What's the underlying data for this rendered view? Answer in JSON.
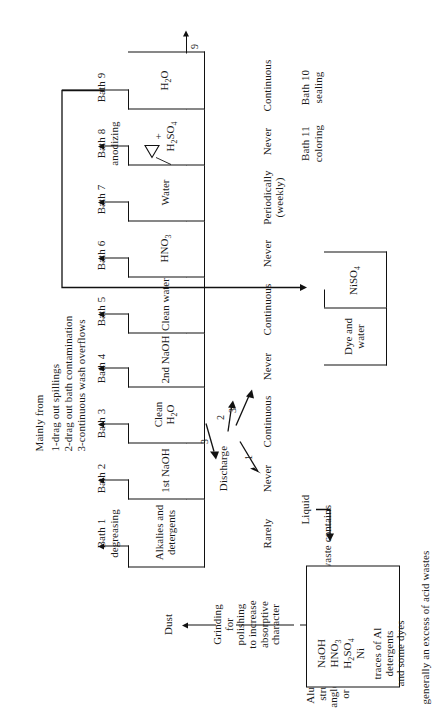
{
  "diagram": {
    "title_hidden": "Aluminum anodizing process flow and waste discharge",
    "feed": {
      "material": "Aluminum\nstructural\nangles, rods,\nor plates",
      "operation": "Grinding\nfor\npolishing\nto increase\nabsorptive\ncharacter",
      "air_waste": "Dust",
      "solid_waste": "Solid\nwaste"
    },
    "discharge_label": "Discharge",
    "baths": [
      {
        "id": 1,
        "name": "Bath 1",
        "subtitle": "degreasing",
        "contents": "Alkalies\nand\ndetergents",
        "stream": "1",
        "frequency": "Rarely"
      },
      {
        "id": 2,
        "name": "Bath 2",
        "subtitle": "",
        "contents": "1st\nNaOH",
        "stream": "2",
        "frequency": "Never"
      },
      {
        "id": 3,
        "name": "Bath 3",
        "subtitle": "",
        "contents": "Clean\nH2O",
        "stream": "3",
        "frequency": "Continuous"
      },
      {
        "id": 4,
        "name": "Bath 4",
        "subtitle": "",
        "contents": "2nd\nNaOH",
        "stream": "4",
        "frequency": "Never"
      },
      {
        "id": 5,
        "name": "Bath 5",
        "subtitle": "",
        "contents": "Clean\nwater",
        "stream": "5",
        "frequency": "Continuous"
      },
      {
        "id": 6,
        "name": "Bath 6",
        "subtitle": "",
        "contents": "HNO3",
        "stream": "6",
        "frequency": "Never"
      },
      {
        "id": 7,
        "name": "Bath 7",
        "subtitle": "",
        "contents": "Water",
        "stream": "7",
        "frequency": "Periodically\n(weekly)"
      },
      {
        "id": 8,
        "name": "Bath 8",
        "subtitle": "anodizing",
        "contents": "H2SO4",
        "stream": "8",
        "frequency": "Never"
      },
      {
        "id": 9,
        "name": "Bath 9",
        "subtitle": "",
        "contents": "H2O",
        "stream": "9",
        "frequency": "Continuous"
      },
      {
        "id": 10,
        "name": "Bath 10",
        "subtitle": "sealing",
        "contents": "NiSO4",
        "stream": "10",
        "frequency": "Never"
      },
      {
        "id": 11,
        "name": "Bath 11",
        "subtitle": "coloring",
        "contents": "Dye\nand\nwater",
        "stream": "11",
        "frequency": "Never"
      }
    ],
    "bath8_heat_symbol": "Δ",
    "bath8_plus": "+",
    "mainly_from": {
      "heading": "Mainly from",
      "items": [
        "1-drag out spillings",
        "2-drag out bath contamination",
        "3-continuous wash overflows"
      ]
    },
    "liquid_label": "Liquid",
    "composite": {
      "caption": "Composite waste contains",
      "chemicals": [
        "NaOH",
        "HNO3",
        "H2SO4",
        "Ni"
      ],
      "traces": "traces of Al\ndetergents\nand some dyes"
    },
    "footnote": "generally an excess of acid wastes"
  },
  "style": {
    "ink": "#111111",
    "paper": "#ffffff"
  }
}
